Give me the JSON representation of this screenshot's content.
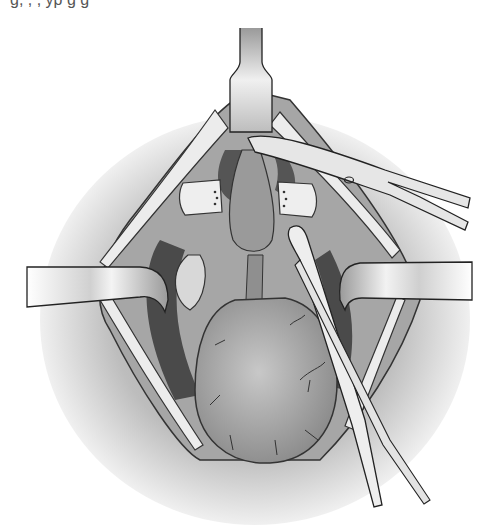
{
  "image": {
    "description": "Grayscale surgical illustration: operative field held open by retractors with forceps/clamp grasping a pear-shaped organ",
    "width": 499,
    "height": 531,
    "palette": {
      "background": "#ffffff",
      "skin_shadow": "#b8b8b8",
      "tissue_mid": "#9a9a9a",
      "cavity_dark": "#4a4a4a",
      "organ": "#a8a8a8",
      "instrument_light": "#e6e6e6",
      "outline": "#222222"
    }
  },
  "caption": {
    "clipped_text": "g,                    ,          ,  yp g                          g"
  },
  "elements": {
    "top_retractor": "retractor-blade-top",
    "left_retractor": "retractor-band-left",
    "right_retractor": "retractor-band-right",
    "clamp": "forceps-clamp-upper-right",
    "long_forceps": "long-forceps-diagonal",
    "organ": "pear-shaped-organ",
    "left_tissue_clamp": "tissue-pad-left",
    "right_tissue_clamp": "tissue-pad-right"
  }
}
